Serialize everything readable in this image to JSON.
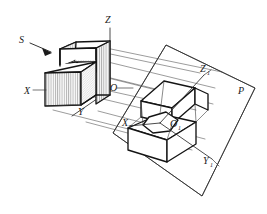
{
  "figure": {
    "type": "technical-line-drawing",
    "canvas": {
      "width": 267,
      "height": 214,
      "background": "#ffffff"
    }
  },
  "labels": {
    "projection_direction": "S",
    "axis_x": "X",
    "axis_y": "Y",
    "axis_z": "Z",
    "origin": "O",
    "axis_x1": "X",
    "axis_x1_sub": "1",
    "axis_y1": "Y",
    "axis_y1_sub": "1",
    "axis_z1": "Z",
    "axis_z1_sub": "1",
    "origin1": "O",
    "origin1_sub": "1",
    "plane": "P"
  },
  "colors": {
    "line": "#1d1d1d",
    "body_line": "#141414",
    "thin_line": "#3a3a3a",
    "ray_line": "#4a4a4a",
    "plane_line": "#2e2e2e",
    "hatch": "#555555",
    "background": "#ffffff",
    "text": "#1a1a1a"
  },
  "elements": {
    "object_name": "stepped-L-block",
    "plane_name": "projection-plane-P",
    "projected_name": "projected-stepped-block",
    "ray_count": 6,
    "arrow_name": "projection-direction-arrow"
  }
}
